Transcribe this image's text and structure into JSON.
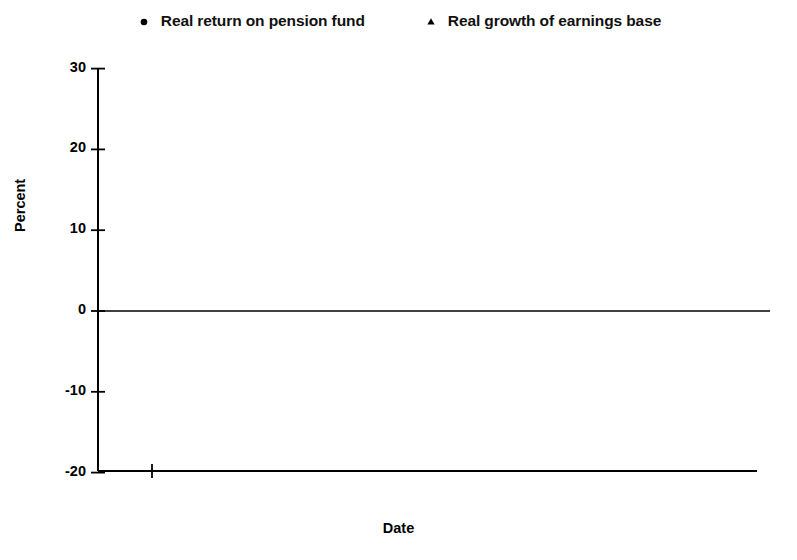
{
  "chart_data": {
    "type": "line",
    "title": "",
    "xlabel": "Date",
    "ylabel": "Percent",
    "xlim": [
      1978.0,
      1995.0
    ],
    "ylim": [
      -20,
      30
    ],
    "xticks": [
      1980,
      1985,
      1990,
      1995
    ],
    "yticks": [
      -20,
      -10,
      0,
      10,
      20,
      30
    ],
    "grid": false,
    "zero_line": true,
    "legend_position": "top-center",
    "x": [
      1979,
      1980,
      1981,
      1982,
      1983,
      1984,
      1985,
      1986,
      1987,
      1988,
      1989,
      1990,
      1991,
      1992,
      1993,
      1994
    ],
    "series": [
      {
        "name": "Real return on pension fund",
        "marker": "circle",
        "color": "#000000",
        "values": [
          -20.1,
          15.2,
          -2.7,
          28.0,
          16.8,
          11.2,
          26.2,
          18.3,
          -9.4,
          13.3,
          1.0,
          0.2,
          0.0,
          23.3,
          14.7,
          -2.8
        ]
      },
      {
        "name": "Real growth of earnings base",
        "marker": "triangle",
        "color": "#000000",
        "values": [
          2.9,
          2.1,
          -3.6,
          -2.3,
          1.5,
          2.0,
          3.4,
          3.9,
          4.2,
          5.0,
          6.9,
          4.7,
          -2.0,
          -1.1,
          -1.5,
          0.3
        ]
      }
    ]
  },
  "axis": {
    "ytick_labels": [
      "30",
      "20",
      "10",
      "0",
      "-10",
      "-20"
    ],
    "xtick_labels": [
      "1980",
      "1985",
      "1990",
      "1995"
    ],
    "ylabel_text": "Percent",
    "xlabel_text": "Date"
  },
  "legend": {
    "items": [
      {
        "label": "Real return on pension fund",
        "marker": "circle"
      },
      {
        "label": "Real growth of earnings base",
        "marker": "triangle"
      }
    ]
  }
}
